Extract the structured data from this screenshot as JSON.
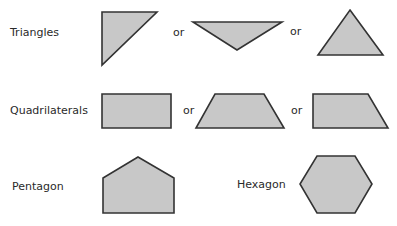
{
  "rows": [
    {
      "label": "Triangles",
      "connectors": [
        "or",
        "or"
      ],
      "shapes": [
        {
          "name": "right-triangle",
          "points": "102,12 157,12 102,65"
        },
        {
          "name": "inverted-obtuse-triangle",
          "points": "193,22 282,22 237,50"
        },
        {
          "name": "isosceles-triangle",
          "points": "350,10 383,55 318,55"
        }
      ]
    },
    {
      "label": "Quadrilaterals",
      "connectors": [
        "or",
        "or"
      ],
      "shapes": [
        {
          "name": "rectangle",
          "points": "102,94 171,94 171,128 102,128"
        },
        {
          "name": "isosceles-trapezoid",
          "points": "215,94 264,94 284,128 196,128"
        },
        {
          "name": "right-trapezoid",
          "points": "313,94 368,94 388,128 313,128"
        }
      ]
    },
    {
      "label": "Pentagon",
      "shapes": [
        {
          "name": "pentagon",
          "points": "138,157 174,178 174,213 103,213 103,178"
        }
      ]
    },
    {
      "label": "Hexagon",
      "shapes": [
        {
          "name": "hexagon",
          "points": "317,156 355,156 372,184 355,213 317,213 300,184"
        }
      ]
    }
  ],
  "colors": {
    "fill": "#c8c8c8",
    "stroke": "#333333",
    "text": "#2a2a2a",
    "background": "#ffffff"
  }
}
